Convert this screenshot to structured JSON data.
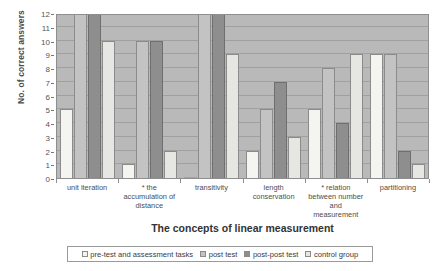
{
  "chart_data": {
    "type": "bar",
    "title": "",
    "xlabel": "The concepts of linear measurement",
    "ylabel": "No. of correct answers",
    "ylim": [
      0,
      12
    ],
    "yticks": [
      0,
      1,
      2,
      3,
      4,
      5,
      6,
      7,
      8,
      9,
      10,
      11,
      12
    ],
    "grid": true,
    "legend_position": "bottom",
    "categories": [
      "unit iteration",
      "* the accumulation of distance",
      "transitivity",
      "length conservation",
      "* relation between number and measurement",
      "partitioning"
    ],
    "series": [
      {
        "name": "pre-test and assessment tasks",
        "color": "#f4f4f1",
        "values": [
          5,
          1,
          0,
          2,
          5,
          9
        ]
      },
      {
        "name": "post test",
        "color": "#c3c3c3",
        "values": [
          12,
          10,
          12,
          5,
          8,
          9
        ]
      },
      {
        "name": "post-post test",
        "color": "#8e8e8e",
        "values": [
          12,
          10,
          12,
          7,
          4,
          2
        ]
      },
      {
        "name": "control group",
        "color": "#e6e6e2",
        "values": [
          10,
          2,
          9,
          3,
          9,
          1
        ]
      }
    ]
  },
  "axes": {
    "y_title": "No. of correct answers",
    "x_title": "The concepts of linear measurement",
    "x_tick_labels": [
      "unit iteration",
      "* the accumulation of distance",
      "transitivity",
      "length conservation",
      "* relation between number and measurement",
      "partitioning"
    ],
    "y_tick_labels": [
      "12",
      "11",
      "10",
      "9",
      "8",
      "7",
      "6",
      "5",
      "4",
      "3",
      "2",
      "1",
      "0"
    ]
  },
  "legend": {
    "entries": [
      {
        "label": "pre-test and assessment tasks",
        "color": "#f4f4f1"
      },
      {
        "label": "post test",
        "color": "#c3c3c3"
      },
      {
        "label": "post-post test",
        "color": "#8e8e8e"
      },
      {
        "label": "control group",
        "color": "#e6e6e2"
      }
    ]
  },
  "colors": {
    "plot_background": "#b9b9b9",
    "gridline": "#a0a0a0",
    "frame": "#8e8e8e"
  }
}
